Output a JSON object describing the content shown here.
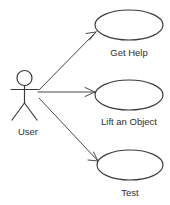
{
  "diagram": {
    "type": "uml-use-case-diagram",
    "background_color": "#ffffff",
    "stroke_color": "#3b3b3b",
    "text_color": "#2e2e2e",
    "actor": {
      "label": "User",
      "label_x": 28,
      "label_y": 135
    },
    "use_cases": [
      {
        "label": "Get Help",
        "cx": 129,
        "cy": 25,
        "rx": 34,
        "ry": 15,
        "label_x": 129,
        "label_y": 56
      },
      {
        "label": "Lift an Object",
        "cx": 129,
        "cy": 95,
        "rx": 34,
        "ry": 15,
        "label_x": 129,
        "label_y": 125
      },
      {
        "label": "Test",
        "cx": 130,
        "cy": 165,
        "rx": 33,
        "ry": 15,
        "label_x": 130,
        "label_y": 196
      }
    ],
    "associations": [
      {
        "name": "user-to-get-help",
        "from_label": "User",
        "to_label": "Get Help",
        "x1": 39,
        "y1": 90,
        "x2": 96,
        "y2": 32
      },
      {
        "name": "user-to-lift-an-object",
        "from_label": "User",
        "to_label": "Lift an Object",
        "x1": 38,
        "y1": 92,
        "x2": 95,
        "y2": 92
      },
      {
        "name": "user-to-test",
        "from_label": "User",
        "to_label": "Test",
        "x1": 39,
        "y1": 98,
        "x2": 98,
        "y2": 161
      }
    ]
  }
}
